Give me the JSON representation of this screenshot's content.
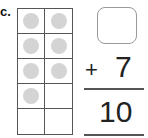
{
  "problem": {
    "label": "c.",
    "ten_frame": {
      "rows": 5,
      "cols": 2,
      "cells": [
        [
          true,
          true
        ],
        [
          true,
          true
        ],
        [
          true,
          true
        ],
        [
          true,
          false
        ],
        [
          false,
          false
        ]
      ],
      "filled_count": 7,
      "dot_color": "#d4d4d4"
    },
    "answer_box": "",
    "operator": "+",
    "addend": "7",
    "sum": "10"
  }
}
